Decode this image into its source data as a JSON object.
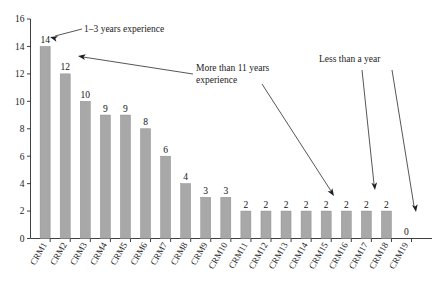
{
  "chart_data": {
    "type": "bar",
    "title": "",
    "xlabel": "",
    "ylabel": "",
    "ylim": [
      0,
      16
    ],
    "ytick_step": 2,
    "yticks": [
      0,
      2,
      4,
      6,
      8,
      10,
      12,
      14,
      16
    ],
    "grid": false,
    "legend": "none",
    "bar_color": "#a8a8a8",
    "bar_edge_color": "#8e8e8e",
    "axis_color": "#2b2b2b",
    "show_value_labels": true,
    "categories": [
      "CRM1",
      "CRM2",
      "CRM3",
      "CRM4",
      "CRM5",
      "CRM6",
      "CRM7",
      "CRM8",
      "CRM9",
      "CRM10",
      "CRM11",
      "CRM12",
      "CRM13",
      "CRM14",
      "CRM15",
      "CRM16",
      "CRM17",
      "CRM18",
      "CRM19"
    ],
    "values": [
      14,
      12,
      10,
      9,
      9,
      8,
      6,
      4,
      3,
      3,
      2,
      2,
      2,
      2,
      2,
      2,
      2,
      2,
      0
    ],
    "value_labels": [
      "14",
      "12",
      "10",
      "9",
      "9",
      "8",
      "6",
      "4",
      "3",
      "3",
      "2",
      "2",
      "2",
      "2",
      "2",
      "2",
      "2",
      "2",
      "0"
    ],
    "annotations": [
      {
        "id": "anno-1-3-years",
        "text": "1–3 years experience",
        "text_x": 84,
        "text_y": 32,
        "anchor": "start",
        "leader": "M 82 29 L 55 36",
        "arrow_x": 50,
        "arrow_y": 37,
        "arrow_angle": 196,
        "target_category": "CRM1"
      },
      {
        "id": "anno-more-than-11-years",
        "text_line1": "More than 11 years",
        "text_line2": "experience",
        "text_x": 196,
        "text_y": 71,
        "anchor": "start",
        "leader": "M 193 74 L 83 57",
        "arrow_x": 78,
        "arrow_y": 56,
        "arrow_angle": 189,
        "target_category": "CRM2",
        "leader2": "M 262 84 L 331 191",
        "arrow2_x": 334,
        "arrow2_y": 196,
        "arrow2_angle": 57,
        "target2_category": "CRM15"
      },
      {
        "id": "anno-less-than-a-year",
        "text": "Less than a year",
        "text_x": 319,
        "text_y": 62,
        "anchor": "start",
        "leader": "M 362 70 L 374 184",
        "arrow_x": 375,
        "arrow_y": 190,
        "arrow_angle": 84,
        "target_category": "CRM17",
        "leader2": "M 392 70 L 414 206",
        "arrow2_x": 416,
        "arrow2_y": 212,
        "arrow2_angle": 81,
        "target2_category": "CRM19"
      }
    ]
  }
}
